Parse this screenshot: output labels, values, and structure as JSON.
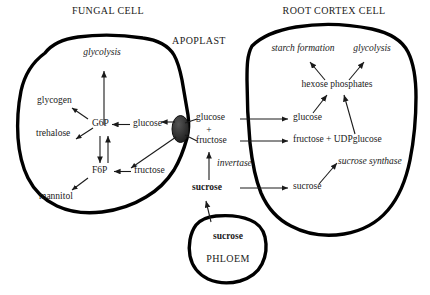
{
  "diagram": {
    "title_fungal": "FUNGAL CELL",
    "title_apoplast": "APOPLAST",
    "title_root": "ROOT CORTEX CELL",
    "phloem_label": "PHLOEM"
  },
  "fungal_cell": {
    "process_glycolysis": "glycolysis",
    "metabolites": {
      "glycogen": "glycogen",
      "trehalose": "trehalose",
      "mannitol": "mannitol",
      "g6p": "G6P",
      "f6p": "F6P",
      "glucose": "glucose",
      "fructose": "fructose"
    }
  },
  "apoplast": {
    "glucose": "glucose",
    "plus": "+",
    "fructose": "fructose",
    "enzyme_invertase": "invertase",
    "sucrose": "sucrose"
  },
  "phloem": {
    "sucrose": "sucrose",
    "name": "PHLOEM"
  },
  "root_cortex_cell": {
    "process_starch": "starch formation",
    "process_glycolysis": "glycolysis",
    "hexose_phosphates": "hexose phosphates",
    "glucose": "glucose",
    "fructose_udpglucose": "fructose + UDPglucose",
    "enzyme_sucrose_synthase": "sucrose synthase",
    "sucrose": "sucrose"
  },
  "colors": {
    "ink": "#1a1a1a",
    "membrane": "#000000",
    "background": "#ffffff",
    "transporter": "#2b2b2b"
  }
}
